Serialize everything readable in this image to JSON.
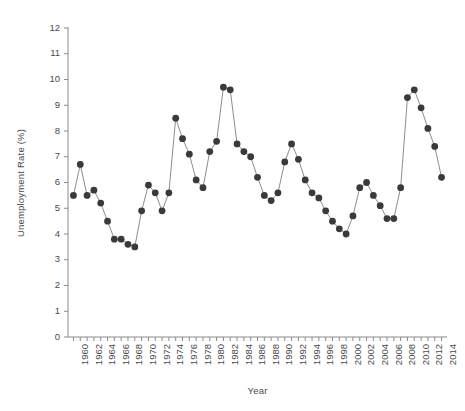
{
  "chart_data": {
    "type": "line",
    "title": "",
    "xlabel": "Year",
    "ylabel": "Unemployment Rate (%)",
    "xlim": [
      1959.2,
      2014.8
    ],
    "ylim": [
      0,
      12
    ],
    "grid": false,
    "legend": null,
    "marker": "filled-circle",
    "marker_color": "#3a3a3a",
    "line_color": "#8c8c8c",
    "y_ticks": [
      0,
      1,
      2,
      3,
      4,
      5,
      6,
      7,
      8,
      9,
      10,
      11,
      12
    ],
    "y_tick_labels": [
      "0",
      "1",
      "2",
      "3",
      "4",
      "5",
      "6",
      "7",
      "8",
      "9",
      "10",
      "11",
      "12"
    ],
    "x_ticks": [
      1960,
      1961,
      1962,
      1963,
      1964,
      1965,
      1966,
      1967,
      1968,
      1969,
      1970,
      1971,
      1972,
      1973,
      1974,
      1975,
      1976,
      1977,
      1978,
      1979,
      1980,
      1981,
      1982,
      1983,
      1984,
      1985,
      1986,
      1987,
      1988,
      1989,
      1990,
      1991,
      1992,
      1993,
      1994,
      1995,
      1996,
      1997,
      1998,
      1999,
      2000,
      2001,
      2002,
      2003,
      2004,
      2005,
      2006,
      2007,
      2008,
      2009,
      2010,
      2011,
      2012,
      2013,
      2014
    ],
    "x_tick_labels": [
      "1960",
      "",
      "1962",
      "",
      "1964",
      "",
      "1966",
      "",
      "1968",
      "",
      "1970",
      "",
      "1972",
      "",
      "1974",
      "",
      "1976",
      "",
      "1978",
      "",
      "1980",
      "",
      "1982",
      "",
      "1984",
      "",
      "1986",
      "",
      "1988",
      "",
      "1990",
      "",
      "1992",
      "",
      "1994",
      "",
      "1996",
      "",
      "1998",
      "",
      "2000",
      "",
      "2002",
      "",
      "2004",
      "",
      "2006",
      "",
      "2008",
      "",
      "2010",
      "",
      "2012",
      "",
      "2014"
    ],
    "x": [
      1960,
      1961,
      1962,
      1963,
      1964,
      1965,
      1966,
      1967,
      1968,
      1969,
      1970,
      1971,
      1972,
      1973,
      1974,
      1975,
      1976,
      1977,
      1978,
      1979,
      1980,
      1981,
      1982,
      1983,
      1984,
      1985,
      1986,
      1987,
      1988,
      1989,
      1990,
      1991,
      1992,
      1993,
      1994,
      1995,
      1996,
      1997,
      1998,
      1999,
      2000,
      2001,
      2002,
      2003,
      2004,
      2005,
      2006,
      2007,
      2008,
      2009,
      2010,
      2011,
      2012,
      2013,
      2014
    ],
    "values": [
      5.5,
      6.7,
      5.5,
      5.7,
      5.2,
      4.5,
      3.8,
      3.8,
      3.6,
      3.5,
      4.9,
      5.9,
      5.6,
      4.9,
      5.6,
      8.5,
      7.7,
      7.1,
      6.1,
      5.8,
      7.2,
      7.6,
      9.7,
      9.6,
      7.5,
      7.2,
      7.0,
      6.2,
      5.5,
      5.3,
      5.6,
      6.8,
      7.5,
      6.9,
      6.1,
      5.6,
      5.4,
      4.9,
      4.5,
      4.2,
      4.0,
      4.7,
      5.8,
      6.0,
      5.5,
      5.1,
      4.6,
      4.6,
      5.8,
      9.3,
      9.6,
      8.9,
      8.1,
      7.4,
      6.2
    ]
  },
  "axes": {
    "y_title": "Unemployment Rate (%)",
    "x_title": "Year"
  }
}
